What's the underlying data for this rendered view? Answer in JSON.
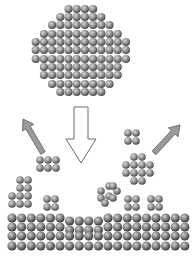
{
  "figure": {
    "title": "Cluster deposition and fragmentation onto a surface",
    "width": 194,
    "height": 260,
    "background": "#ffffff"
  },
  "colors": {
    "sphere_highlight": "#d8d8d8",
    "sphere_mid": "#8a8a8a",
    "sphere_shadow": "#3e3e3e",
    "slab_highlight": "#cfcfcf",
    "slab_mid": "#7a7a7a",
    "slab_shadow": "#2f2f2f",
    "arrow_gray_fill": "#9a9a9a",
    "arrow_gray_stroke": "#5a5a5a",
    "arrow_white_fill": "#ffffff",
    "arrow_white_stroke": "#6a6a6a"
  },
  "incoming_cluster": {
    "label": "large-cluster",
    "radius": 4.1,
    "spacing": 8.2,
    "center_x": 81,
    "rows": [
      {
        "y": 9,
        "count": 4,
        "x0": 68.5
      },
      {
        "y": 17,
        "count": 6,
        "x0": 60.3
      },
      {
        "y": 25,
        "count": 8,
        "x0": 52.1
      },
      {
        "y": 34,
        "count": 10,
        "x0": 43.9
      },
      {
        "y": 42,
        "count": 12,
        "x0": 35.7
      },
      {
        "y": 50,
        "count": 12,
        "x0": 35.7
      },
      {
        "y": 59,
        "count": 12,
        "x0": 35.7
      },
      {
        "y": 67,
        "count": 10,
        "x0": 43.9
      },
      {
        "y": 75,
        "count": 10,
        "x0": 43.9
      },
      {
        "y": 84,
        "count": 8,
        "x0": 52.1
      },
      {
        "y": 92,
        "count": 6,
        "x0": 60.3
      }
    ]
  },
  "arrows": [
    {
      "name": "down-arrow-impact",
      "type": "block-down",
      "x": 81,
      "top": 107,
      "shaft_half": 7,
      "head_half": 15,
      "head_y": 139,
      "tip_y": 163
    },
    {
      "name": "up-left-arrow-ejection",
      "type": "thin",
      "x1": 43,
      "y1": 153,
      "x2": 23,
      "y2": 119
    },
    {
      "name": "up-right-arrow-ejection",
      "type": "thin",
      "x1": 154,
      "y1": 153,
      "x2": 180,
      "y2": 125
    }
  ],
  "fragments": [
    {
      "name": "fragment-2x3-left",
      "radius": 3.8,
      "spheres": [
        [
          40,
          160
        ],
        [
          48,
          160
        ],
        [
          56,
          160
        ],
        [
          40,
          168
        ],
        [
          48,
          168
        ],
        [
          56,
          168
        ]
      ]
    },
    {
      "name": "fragment-2x2-top-right",
      "radius": 3.8,
      "spheres": [
        [
          128,
          133
        ],
        [
          136,
          133
        ],
        [
          128,
          141
        ],
        [
          136,
          141
        ]
      ]
    },
    {
      "name": "fragment-hex-right",
      "radius": 3.8,
      "spheres": [
        [
          134,
          157
        ],
        [
          142,
          157
        ],
        [
          126,
          165
        ],
        [
          134,
          165
        ],
        [
          142,
          165
        ],
        [
          150,
          165
        ],
        [
          126,
          173
        ],
        [
          134,
          173
        ],
        [
          142,
          173
        ],
        [
          150,
          173
        ],
        [
          134,
          181
        ],
        [
          142,
          181
        ]
      ]
    },
    {
      "name": "fragment-tilted-square",
      "radius": 3.8,
      "spheres": [
        [
          109,
          186
        ],
        [
          117,
          191
        ],
        [
          101,
          191
        ],
        [
          109,
          196
        ],
        [
          113,
          186
        ],
        [
          101,
          198
        ],
        [
          105,
          203
        ],
        [
          113,
          198
        ]
      ]
    },
    {
      "name": "adsorbed-column-left",
      "radius": 3.8,
      "spheres": [
        [
          20,
          180
        ],
        [
          28,
          180
        ],
        [
          20,
          188
        ],
        [
          28,
          188
        ],
        [
          12,
          196
        ],
        [
          20,
          196
        ],
        [
          28,
          196
        ],
        [
          12,
          204
        ],
        [
          20,
          204
        ],
        [
          28,
          204
        ]
      ]
    },
    {
      "name": "adsorbed-2x2-left-mid",
      "radius": 3.8,
      "spheres": [
        [
          47,
          199
        ],
        [
          55,
          199
        ],
        [
          47,
          207
        ],
        [
          55,
          207
        ]
      ]
    },
    {
      "name": "adsorbed-2x2-right-a",
      "radius": 3.8,
      "spheres": [
        [
          128,
          199
        ],
        [
          136,
          199
        ],
        [
          128,
          207
        ],
        [
          136,
          207
        ]
      ]
    },
    {
      "name": "adsorbed-2x2-right-b",
      "radius": 3.8,
      "spheres": [
        [
          151,
          199
        ],
        [
          159,
          199
        ],
        [
          151,
          207
        ],
        [
          159,
          207
        ]
      ]
    }
  ],
  "surface_slab": {
    "label": "substrate-surface",
    "radius": 4.6,
    "spacing": 9.6,
    "x0": 12,
    "columns": 19,
    "rows_y": [
      218,
      227,
      236,
      246
    ],
    "defect_region": {
      "x_min": 64,
      "x_max": 100,
      "y_offset": 3
    }
  }
}
